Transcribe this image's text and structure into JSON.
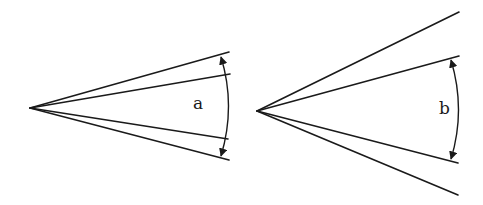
{
  "figures": [
    {
      "id": "a",
      "label": "a",
      "apex": [
        30,
        108
      ],
      "outer_lines": [
        [
          229,
          52
        ],
        [
          229,
          160
        ]
      ],
      "inner_lines": [
        [
          230,
          74
        ],
        [
          228,
          139
        ]
      ],
      "arc": {
        "from": [
          221,
          56
        ],
        "to": [
          221,
          157
        ],
        "ctrl": [
          236,
          106
        ]
      },
      "label_pos": [
        193,
        109
      ]
    },
    {
      "id": "b",
      "label": "b",
      "apex": [
        257,
        111
      ],
      "outer_lines": [
        [
          459,
          12
        ],
        [
          458,
          195
        ]
      ],
      "inner_lines": [
        [
          459,
          56
        ],
        [
          458,
          163
        ]
      ],
      "arc": {
        "from": [
          451,
          59
        ],
        "to": [
          451,
          160
        ],
        "ctrl": [
          466,
          110
        ]
      },
      "label_pos": [
        441,
        114
      ]
    }
  ],
  "colors": {
    "stroke": "#1a1a1a",
    "background": "#ffffff"
  }
}
